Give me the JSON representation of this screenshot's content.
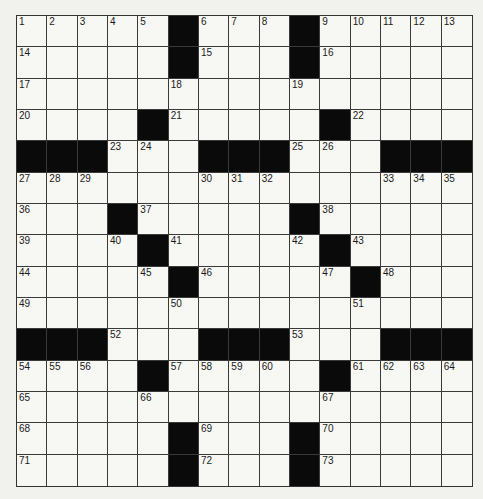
{
  "puzzle": {
    "rows": 15,
    "cols": 15,
    "layout": [
      "#1,2,3,4,5,X,6,7,8,X,9,10,11,12,13",
      "#14,.,.,.,.,X,15,.,.,X,16,.,.,.,.",
      "#17,.,.,.,.,18,.,.,.,19,.,.,.,.,.",
      "#20,.,.,.,X,21,.,.,.,.,X,22,.,.,.",
      "#X,X,X,23,24,.,X,X,X,25,26,.,X,X,X",
      "#27,28,29,.,.,.,30,31,32,.,.,.,33,34,35",
      "#36,.,.,X,37,.,.,.,.,X,38,.,.,.,.",
      "#39,.,.,40,X,41,.,.,.,42,X,43,.,.,.",
      "#44,.,.,.,45,X,46,.,.,.,47,X,48,.,.",
      "#49,.,.,.,.,50,.,.,.,.,.,51,.,.,.",
      "#X,X,X,52,.,.,X,X,X,53,.,.,X,X,X",
      "#54,55,56,.,X,57,58,59,60,.,X,61,62,63,64",
      "#65,.,.,.,66,.,.,.,.,.,67,.,.,.,.",
      "#68,.,.,.,.,X,69,.,.,X,70,.,.,.,.",
      "#71,.,.,.,.,X,72,.,.,X,73,.,.,.,."
    ],
    "colors": {
      "paper": "#f1f1ee",
      "cell": "#f7f7f4",
      "block": "#0a0a0a",
      "line": "#3a3a3a",
      "number": "#1a1a1a"
    }
  }
}
